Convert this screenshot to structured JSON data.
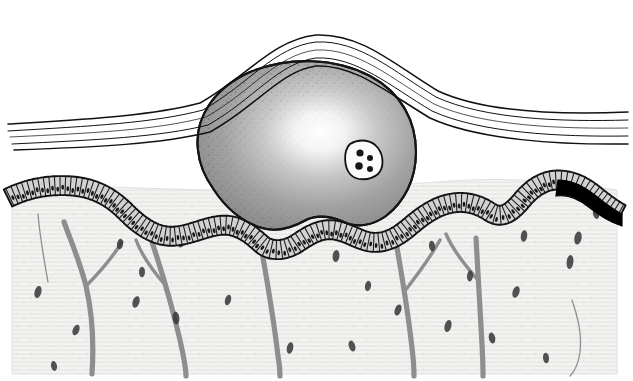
{
  "figure": {
    "title": "Histologic cross-section illustration of a submucosal nodular lesion",
    "type": "anatomical-line-illustration",
    "style": "black-and-white pen-and-ink with stipple shading",
    "canvas": {
      "width": 633,
      "height": 381
    },
    "background_color": "#ffffff"
  },
  "colors": {
    "ink": "#111111",
    "outline": "#1a1a1a",
    "tissue_field": "#f2f2f0",
    "tissue_field_edge": "#e4e4e2",
    "mass_dark": "#8a8a8a",
    "mass_mid": "#b4b4b4",
    "mass_light": "#fbfbfb",
    "epithelium_fill": "#c9c9c9",
    "epithelium_fill_light": "#dcdcdc",
    "nucleus": "#171717",
    "vessel": "#8e8e8e",
    "vessel_dark": "#7a7a7a",
    "pigment_black": "#000000",
    "stipple": "#3a3a3a",
    "hatch_line": "#dedede",
    "thin_line": "#9a9a9a"
  },
  "layers": [
    {
      "id": "surface-membrane",
      "label": "Surface membrane / superficial lamellar layer",
      "description": "Four to five thin parallel ink lines sweeping across the top of the field, arching upward over the nodule",
      "line_count": 5
    },
    {
      "id": "mass",
      "label": "Submucosal nodular mass",
      "description": "Large rounded stippled mass with radial highlight, occupying the upper centre of the field",
      "highlight": {
        "cx": 320,
        "cy": 132
      },
      "bounds": {
        "x": 192,
        "y": 62,
        "width": 225,
        "height": 170
      }
    },
    {
      "id": "giant-cell",
      "label": "Multinucleated giant cell inclusion",
      "description": "Pale rounded cell within the mass containing four dark nuclei",
      "center": {
        "x": 362,
        "y": 158
      },
      "nuclei_count": 4
    },
    {
      "id": "epithelium",
      "label": "Columnar epithelial layer",
      "description": "Undulating single-cell-thick palisade of columnar cells, each with a dark oval nucleus, running the full width beneath the mass",
      "cell_count_approx": 115
    },
    {
      "id": "pigmented-segment",
      "label": "Pigmented (melanotic) epithelial segment",
      "description": "Solid black thickened portion of the epithelium at the right edge of the field",
      "bounds": {
        "x": 560,
        "y": 176,
        "width": 62,
        "height": 50
      }
    },
    {
      "id": "stroma",
      "label": "Underlying connective-tissue stroma",
      "description": "Lightly hatched field containing branching vessels and scattered elongated fibroblast nuclei",
      "bounds": {
        "x": 12,
        "y": 190,
        "width": 605,
        "height": 185
      }
    },
    {
      "id": "vessels",
      "label": "Branching blood vessels",
      "description": "Grey branching vascular trunks descending from the epithelial interface into the stroma",
      "trunk_count": 5
    },
    {
      "id": "fibroblasts",
      "label": "Stromal fibroblast nuclei",
      "description": "Small dark elongated ovals scattered through the stroma",
      "count": 24
    }
  ],
  "geometry": {
    "membrane_lines": [
      "M 8 124 C 90 119 150 116 200 103 C 248 76 272 40 316 35 C 362 33 396 66 438 91 C 486 113 560 115 628 112",
      "M 8 131 C 92 126 154 123 203 110 C 250 83 274 47 316 42 C 360 40 394 72 436 97 C 484 119 560 122 628 120",
      "M 10 137 C 94 133 158 130 206 117 C 252 91 276 55 316 50 C 358 48 392 79 434 104 C 482 126 560 129 628 128",
      "M 12 144 C 96 140 160 137 208 125 C 254 99 278 63 316 58 C 356 56 390 86 432 111 C 480 133 560 137 628 136",
      "M 14 150 C 98 147 162 144 210 132 C 256 107 280 71 316 66 C 354 64 388 93 430 118 C 478 140 560 145 628 144"
    ],
    "mass_outline": "M 198 150 C 194 118 214 88 250 72 C 290 56 336 58 370 76 C 402 93 416 122 416 152 C 416 180 404 202 386 216 C 372 226 356 228 344 222 C 330 216 318 214 306 220 C 292 228 276 232 262 228 C 242 222 226 208 214 190 C 204 176 199 163 198 150 Z",
    "tissue_field": "M 12 190 L 12 374 L 617 374 L 617 190 C 560 182 520 178 470 180 C 420 182 380 188 330 190 C 270 192 200 190 140 188 C 92 186 50 187 12 190 Z",
    "epithelium_path": "M 8 198 C 26 189 48 184 72 186 C 96 188 112 198 126 212 C 142 228 158 238 176 236 C 196 234 214 222 232 226 C 248 230 256 240 264 246 C 274 252 286 250 296 244 C 308 236 320 228 334 230 C 348 232 358 240 370 242 C 384 244 396 238 408 228 C 420 218 432 208 448 204 C 464 200 478 204 490 212 C 502 220 512 212 522 200 C 532 188 544 180 558 180 C 572 180 584 186 596 196 C 606 204 614 210 622 214",
    "pigment_path": "M 558 180 C 572 180 584 186 596 196 C 606 204 614 210 622 214 L 622 226 C 610 222 600 216 590 208 C 578 198 568 194 556 196 Z"
  },
  "vessels": [
    {
      "id": "vessel-left",
      "path": "M 64 222 C 72 244 80 262 86 286 C 92 312 94 344 92 374",
      "branch": "M 86 286 C 100 272 112 258 122 242"
    },
    {
      "id": "vessel-left-thin",
      "path": "M 38 214 C 40 238 44 260 48 282"
    },
    {
      "id": "vessel-center-left",
      "path": "M 152 242 C 162 272 172 306 180 340 C 184 358 186 368 186 376",
      "branch": "M 166 286 C 152 270 142 256 136 240"
    },
    {
      "id": "vessel-center",
      "path": "M 262 252 C 268 286 274 322 278 356 C 280 366 280 372 280 376"
    },
    {
      "id": "vessel-right-center",
      "path": "M 396 242 C 402 276 408 312 412 348 C 414 364 414 372 414 376",
      "branch": "M 404 292 C 418 274 430 258 440 240"
    },
    {
      "id": "vessel-right",
      "path": "M 476 238 C 478 272 480 308 482 344 C 483 362 483 372 483 376",
      "branch": "M 478 280 C 462 262 452 248 446 234"
    },
    {
      "id": "vessel-thin-right",
      "path": "M 572 300 C 578 318 582 334 580 352 C 578 366 574 372 570 376"
    }
  ],
  "fibroblasts": [
    {
      "x": 38,
      "y": 292,
      "rx": 3.4,
      "ry": 6.2,
      "rot": 14
    },
    {
      "x": 54,
      "y": 366,
      "rx": 3.0,
      "ry": 5.0,
      "rot": -10
    },
    {
      "x": 76,
      "y": 330,
      "rx": 3.2,
      "ry": 5.6,
      "rot": 22
    },
    {
      "x": 120,
      "y": 244,
      "rx": 3.0,
      "ry": 5.4,
      "rot": 8
    },
    {
      "x": 136,
      "y": 302,
      "rx": 3.4,
      "ry": 6.0,
      "rot": 18
    },
    {
      "x": 176,
      "y": 318,
      "rx": 3.4,
      "ry": 6.4,
      "rot": -6
    },
    {
      "x": 182,
      "y": 242,
      "rx": 3.2,
      "ry": 5.8,
      "rot": 26
    },
    {
      "x": 142,
      "y": 272,
      "rx": 3.0,
      "ry": 5.2,
      "rot": 0
    },
    {
      "x": 228,
      "y": 300,
      "rx": 3.0,
      "ry": 5.4,
      "rot": 16
    },
    {
      "x": 268,
      "y": 254,
      "rx": 3.2,
      "ry": 5.6,
      "rot": -14
    },
    {
      "x": 290,
      "y": 348,
      "rx": 3.2,
      "ry": 5.8,
      "rot": 12
    },
    {
      "x": 336,
      "y": 256,
      "rx": 3.4,
      "ry": 6.0,
      "rot": 6
    },
    {
      "x": 352,
      "y": 346,
      "rx": 3.2,
      "ry": 5.6,
      "rot": -18
    },
    {
      "x": 368,
      "y": 286,
      "rx": 3.0,
      "ry": 5.2,
      "rot": 10
    },
    {
      "x": 398,
      "y": 310,
      "rx": 3.2,
      "ry": 5.8,
      "rot": 20
    },
    {
      "x": 432,
      "y": 246,
      "rx": 3.0,
      "ry": 5.2,
      "rot": -8
    },
    {
      "x": 448,
      "y": 326,
      "rx": 3.4,
      "ry": 6.2,
      "rot": 14
    },
    {
      "x": 470,
      "y": 276,
      "rx": 3.0,
      "ry": 5.4,
      "rot": 4
    },
    {
      "x": 492,
      "y": 338,
      "rx": 3.2,
      "ry": 5.6,
      "rot": -12
    },
    {
      "x": 516,
      "y": 292,
      "rx": 3.4,
      "ry": 6.0,
      "rot": 18
    },
    {
      "x": 524,
      "y": 236,
      "rx": 3.2,
      "ry": 5.8,
      "rot": 8
    },
    {
      "x": 546,
      "y": 358,
      "rx": 3.0,
      "ry": 5.2,
      "rot": -6
    },
    {
      "x": 578,
      "y": 238,
      "rx": 3.6,
      "ry": 6.6,
      "rot": 10
    },
    {
      "x": 570,
      "y": 262,
      "rx": 3.4,
      "ry": 7.0,
      "rot": 6
    },
    {
      "x": 596,
      "y": 214,
      "rx": 3.0,
      "ry": 5.0,
      "rot": -16
    }
  ],
  "giant_cell": {
    "outline": "M 350 144 C 360 138 372 140 378 148 C 384 156 384 168 378 174 C 370 181 356 181 350 174 C 344 167 343 151 350 144 Z",
    "nuclei": [
      {
        "x": 360,
        "y": 153,
        "r": 3.6
      },
      {
        "x": 370,
        "y": 158,
        "r": 3.0
      },
      {
        "x": 359,
        "y": 166,
        "r": 3.8
      },
      {
        "x": 370,
        "y": 169,
        "r": 3.0
      }
    ]
  }
}
